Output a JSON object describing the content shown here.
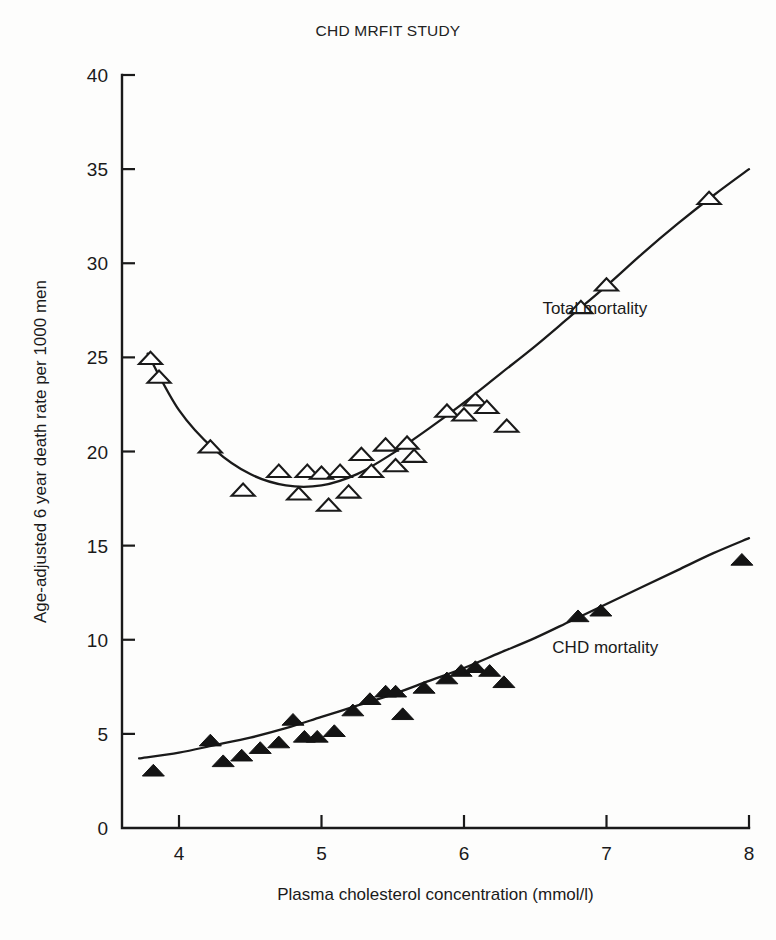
{
  "figure": {
    "title": "CHD MRFIT STUDY"
  },
  "chart_data": {
    "type": "scatter",
    "title": "CHD MRFIT STUDY",
    "xlabel": "Plasma cholesterol concentration (mmol/l)",
    "ylabel": "Age-adjusted 6 year death rate per 1000 men",
    "xlim": [
      3.6,
      8.0
    ],
    "ylim": [
      0,
      40
    ],
    "xticks": [
      4,
      5,
      6,
      7,
      8
    ],
    "xtick_labels": [
      "4",
      "5",
      "6",
      "7",
      "8"
    ],
    "yticks": [
      0,
      5,
      10,
      15,
      20,
      25,
      30,
      35,
      40
    ],
    "ytick_labels": [
      "0",
      "5",
      "10",
      "15",
      "20",
      "25",
      "30",
      "35",
      "40"
    ],
    "grid": false,
    "legend_position": "inline-annotation",
    "series": [
      {
        "name": "Total mortality",
        "marker": "open-triangle",
        "label_x": 6.55,
        "label_y": 27.3,
        "points": [
          {
            "x": 3.8,
            "y": 24.9
          },
          {
            "x": 3.86,
            "y": 23.9
          },
          {
            "x": 4.22,
            "y": 20.2
          },
          {
            "x": 4.45,
            "y": 17.9
          },
          {
            "x": 4.7,
            "y": 18.9
          },
          {
            "x": 4.84,
            "y": 17.7
          },
          {
            "x": 4.9,
            "y": 18.9
          },
          {
            "x": 5.0,
            "y": 18.8
          },
          {
            "x": 5.05,
            "y": 17.1
          },
          {
            "x": 5.13,
            "y": 18.9
          },
          {
            "x": 5.19,
            "y": 17.8
          },
          {
            "x": 5.28,
            "y": 19.8
          },
          {
            "x": 5.35,
            "y": 18.9
          },
          {
            "x": 5.45,
            "y": 20.3
          },
          {
            "x": 5.52,
            "y": 19.2
          },
          {
            "x": 5.6,
            "y": 20.4
          },
          {
            "x": 5.65,
            "y": 19.7
          },
          {
            "x": 5.88,
            "y": 22.1
          },
          {
            "x": 6.0,
            "y": 21.9
          },
          {
            "x": 6.08,
            "y": 22.7
          },
          {
            "x": 6.16,
            "y": 22.3
          },
          {
            "x": 6.3,
            "y": 21.3
          },
          {
            "x": 6.82,
            "y": 27.6
          },
          {
            "x": 7.0,
            "y": 28.8
          },
          {
            "x": 7.72,
            "y": 33.4
          }
        ],
        "fit_curve": [
          {
            "x": 3.78,
            "y": 25.2
          },
          {
            "x": 4.0,
            "y": 22.2
          },
          {
            "x": 4.25,
            "y": 20.1
          },
          {
            "x": 4.5,
            "y": 18.8
          },
          {
            "x": 4.75,
            "y": 18.2
          },
          {
            "x": 5.0,
            "y": 18.2
          },
          {
            "x": 5.25,
            "y": 18.8
          },
          {
            "x": 5.5,
            "y": 19.9
          },
          {
            "x": 5.75,
            "y": 21.2
          },
          {
            "x": 6.0,
            "y": 22.6
          },
          {
            "x": 6.25,
            "y": 24.1
          },
          {
            "x": 6.5,
            "y": 25.6
          },
          {
            "x": 6.75,
            "y": 27.2
          },
          {
            "x": 7.0,
            "y": 28.8
          },
          {
            "x": 7.25,
            "y": 30.5
          },
          {
            "x": 7.5,
            "y": 32.1
          },
          {
            "x": 7.75,
            "y": 33.6
          },
          {
            "x": 8.0,
            "y": 35.0
          }
        ]
      },
      {
        "name": "CHD mortality",
        "marker": "filled-triangle",
        "label_x": 6.62,
        "label_y": 9.3,
        "points": [
          {
            "x": 3.82,
            "y": 3.0
          },
          {
            "x": 4.22,
            "y": 4.6
          },
          {
            "x": 4.31,
            "y": 3.5
          },
          {
            "x": 4.44,
            "y": 3.8
          },
          {
            "x": 4.57,
            "y": 4.2
          },
          {
            "x": 4.7,
            "y": 4.5
          },
          {
            "x": 4.8,
            "y": 5.7
          },
          {
            "x": 4.88,
            "y": 4.8
          },
          {
            "x": 4.97,
            "y": 4.8
          },
          {
            "x": 5.09,
            "y": 5.1
          },
          {
            "x": 5.22,
            "y": 6.2
          },
          {
            "x": 5.34,
            "y": 6.8
          },
          {
            "x": 5.45,
            "y": 7.2
          },
          {
            "x": 5.52,
            "y": 7.2
          },
          {
            "x": 5.57,
            "y": 6.0
          },
          {
            "x": 5.72,
            "y": 7.4
          },
          {
            "x": 5.88,
            "y": 7.9
          },
          {
            "x": 5.98,
            "y": 8.3
          },
          {
            "x": 6.08,
            "y": 8.5
          },
          {
            "x": 6.18,
            "y": 8.3
          },
          {
            "x": 6.28,
            "y": 7.7
          },
          {
            "x": 6.8,
            "y": 11.2
          },
          {
            "x": 6.96,
            "y": 11.5
          },
          {
            "x": 7.95,
            "y": 14.2
          }
        ],
        "fit_curve": [
          {
            "x": 3.72,
            "y": 3.7
          },
          {
            "x": 4.0,
            "y": 4.0
          },
          {
            "x": 4.25,
            "y": 4.4
          },
          {
            "x": 4.5,
            "y": 4.8
          },
          {
            "x": 4.75,
            "y": 5.3
          },
          {
            "x": 5.0,
            "y": 5.9
          },
          {
            "x": 5.25,
            "y": 6.5
          },
          {
            "x": 5.5,
            "y": 7.1
          },
          {
            "x": 5.75,
            "y": 7.8
          },
          {
            "x": 6.0,
            "y": 8.5
          },
          {
            "x": 6.25,
            "y": 9.3
          },
          {
            "x": 6.5,
            "y": 10.1
          },
          {
            "x": 6.75,
            "y": 11.0
          },
          {
            "x": 7.0,
            "y": 11.9
          },
          {
            "x": 7.25,
            "y": 12.8
          },
          {
            "x": 7.5,
            "y": 13.7
          },
          {
            "x": 7.75,
            "y": 14.6
          },
          {
            "x": 8.0,
            "y": 15.4
          }
        ]
      }
    ]
  }
}
